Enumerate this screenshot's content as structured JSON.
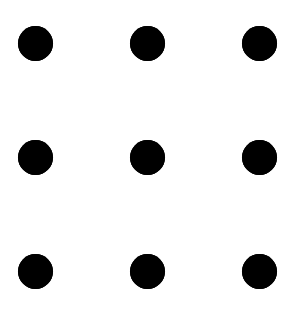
{
  "diagram": {
    "type": "dot-grid",
    "rows": 3,
    "cols": 3,
    "dot_color": "#000000",
    "background_color": "#ffffff",
    "dot_diameter": 35,
    "col_centers_x": [
      35,
      147,
      259
    ],
    "row_centers_y": [
      43,
      157,
      271
    ],
    "dots": [
      {
        "row": 0,
        "col": 0
      },
      {
        "row": 0,
        "col": 1
      },
      {
        "row": 0,
        "col": 2
      },
      {
        "row": 1,
        "col": 0
      },
      {
        "row": 1,
        "col": 1
      },
      {
        "row": 1,
        "col": 2
      },
      {
        "row": 2,
        "col": 0
      },
      {
        "row": 2,
        "col": 1
      },
      {
        "row": 2,
        "col": 2
      }
    ]
  }
}
